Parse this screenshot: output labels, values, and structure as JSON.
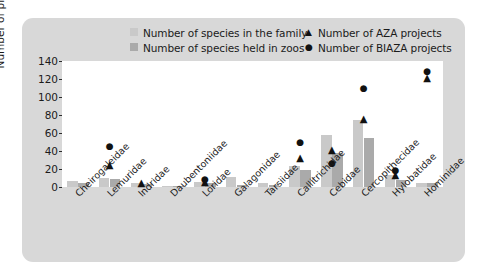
{
  "legend": {
    "items": [
      {
        "label": "Number of species in the family",
        "marker": "square-light",
        "color": "#c9c9c9"
      },
      {
        "label": "Number of species held in zoos",
        "marker": "square-dark",
        "color": "#aaaaaa"
      },
      {
        "label": "Number of AZA projects",
        "marker": "triangle",
        "color": "#111111"
      },
      {
        "label": "Number of BIAZA projects",
        "marker": "circle",
        "color": "#111111"
      }
    ]
  },
  "axis": {
    "y_label": "Number of projects",
    "y_ticks": [
      "140",
      "120",
      "100",
      "80",
      "60",
      "40",
      "20",
      "0"
    ]
  },
  "chart_data": {
    "type": "bar",
    "title": "",
    "xlabel": "",
    "ylabel": "Number of projects",
    "ylim": [
      0,
      140
    ],
    "ytick_values": [
      0,
      20,
      40,
      60,
      80,
      100,
      120,
      140
    ],
    "grid": false,
    "legend_position": "top",
    "categories": [
      "Cheirogaleidae",
      "Lemuridae",
      "Indridae",
      "Daubentoniidae",
      "Loridae",
      "Galagonidae",
      "Tarsiidae",
      "Callitrichidae",
      "Cebidae",
      "Cercopithecidae",
      "Hylobatidae",
      "Hominidae"
    ],
    "series": [
      {
        "name": "Number of species in the family",
        "type": "bar",
        "color": "#c9c9c9",
        "values": [
          7,
          10,
          5,
          1,
          6,
          11,
          5,
          23,
          58,
          74,
          13,
          5
        ]
      },
      {
        "name": "Number of species held in zoos",
        "type": "bar",
        "color": "#aaaaaa",
        "values": [
          5,
          9,
          3,
          1,
          5,
          2,
          2,
          19,
          38,
          55,
          8,
          4
        ]
      },
      {
        "name": "Number of AZA projects",
        "type": "marker",
        "marker": "triangle",
        "color": "#111111",
        "values": [
          null,
          25,
          5,
          null,
          6,
          null,
          null,
          32,
          41,
          76,
          13,
          121
        ]
      },
      {
        "name": "Number of BIAZA projects",
        "type": "marker",
        "marker": "circle",
        "color": "#111111",
        "values": [
          null,
          45,
          null,
          null,
          8,
          null,
          null,
          49,
          26,
          110,
          18,
          128
        ]
      }
    ]
  }
}
